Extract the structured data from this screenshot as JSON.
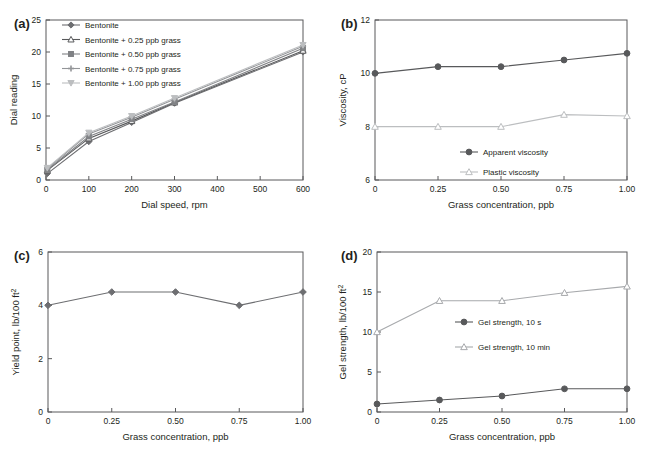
{
  "figure": {
    "panels": [
      "a",
      "b",
      "c",
      "d"
    ]
  },
  "panel_a": {
    "tag": "(a)",
    "chart_data": {
      "type": "line",
      "title": "",
      "xlabel": "Dial speed, rpm",
      "ylabel": "Dial reading",
      "xlim": [
        0,
        600
      ],
      "ylim": [
        0,
        25
      ],
      "xticks": [
        0,
        100,
        200,
        300,
        400,
        500,
        600
      ],
      "xticklabels": [
        "0",
        "100",
        "200",
        "300",
        "400",
        "500",
        "600"
      ],
      "yticks": [
        0,
        5,
        10,
        15,
        20,
        25
      ],
      "yticklabels": [
        "0",
        "5",
        "10",
        "15",
        "20",
        "25"
      ],
      "grid": false,
      "legend_position": "upper left",
      "x": [
        3,
        100,
        200,
        300,
        600
      ],
      "series": [
        {
          "name": "Bentonite",
          "values": [
            1.0,
            6.0,
            9.0,
            12.0,
            20.0
          ],
          "marker": "diamond",
          "color": "#6d6e71"
        },
        {
          "name": "Bentonite + 0.25 ppb grass",
          "values": [
            1.5,
            6.5,
            9.2,
            12.1,
            20.2
          ],
          "marker": "triangle",
          "color": "#58595b"
        },
        {
          "name": "Bentonite + 0.50 ppb grass",
          "values": [
            1.6,
            6.8,
            9.5,
            12.2,
            20.6
          ],
          "marker": "square",
          "color": "#808285"
        },
        {
          "name": "Bentonite + 0.75 ppb grass",
          "values": [
            1.8,
            7.2,
            9.8,
            12.6,
            20.9
          ],
          "marker": "cross",
          "color": "#939598"
        },
        {
          "name": "Bentonite + 1.00 ppb grass",
          "values": [
            1.9,
            7.4,
            10.0,
            12.8,
            21.1
          ],
          "marker": "triangle-down",
          "color": "#bcbec0"
        }
      ]
    }
  },
  "panel_b": {
    "tag": "(b)",
    "chart_data": {
      "type": "line",
      "title": "",
      "xlabel": "Grass concentration, ppb",
      "ylabel": "Viscosity, cP",
      "xlim": [
        0,
        1.0
      ],
      "ylim": [
        6,
        12
      ],
      "xticks": [
        0,
        0.25,
        0.5,
        0.75,
        1.0
      ],
      "xticklabels": [
        "0",
        "0.25",
        "0.50",
        "0.75",
        "1.00"
      ],
      "yticks": [
        6,
        8,
        10,
        12
      ],
      "yticklabels": [
        "6",
        "8",
        "10",
        "12"
      ],
      "grid": false,
      "legend_position": "lower center",
      "x": [
        0,
        0.25,
        0.5,
        0.75,
        1.0
      ],
      "series": [
        {
          "name": "Apparent viscosity",
          "values": [
            10.0,
            10.25,
            10.25,
            10.5,
            10.75
          ],
          "marker": "circle",
          "color": "#58595b"
        },
        {
          "name": "Plastic viscosity",
          "values": [
            8.0,
            8.0,
            8.0,
            8.45,
            8.4
          ],
          "marker": "triangle",
          "color": "#bcbec0"
        }
      ]
    }
  },
  "panel_c": {
    "tag": "(c)",
    "chart_data": {
      "type": "line",
      "title": "",
      "xlabel": "Grass concentration, ppb",
      "ylabel": "Yield point, lb/100 ft",
      "ylabel_sup": "2",
      "xlim": [
        0,
        1.0
      ],
      "ylim": [
        0,
        6
      ],
      "xticks": [
        0,
        0.25,
        0.5,
        0.75,
        1.0
      ],
      "xticklabels": [
        "0",
        "0.25",
        "0.50",
        "0.75",
        "1.00"
      ],
      "yticks": [
        0,
        2,
        4,
        6
      ],
      "yticklabels": [
        "0",
        "2",
        "4",
        "6"
      ],
      "grid": false,
      "legend_position": "none",
      "x": [
        0,
        0.25,
        0.5,
        0.75,
        1.0
      ],
      "series": [
        {
          "name": "Yield point",
          "values": [
            4.0,
            4.5,
            4.5,
            4.0,
            4.5
          ],
          "marker": "diamond",
          "color": "#6d6e71"
        }
      ]
    }
  },
  "panel_d": {
    "tag": "(d)",
    "chart_data": {
      "type": "line",
      "title": "",
      "xlabel": "Grass concentration, ppb",
      "ylabel": "Gel strength, lb/100 ft",
      "ylabel_sup": "2",
      "xlim": [
        0,
        1.0
      ],
      "ylim": [
        0,
        20
      ],
      "xticks": [
        0,
        0.25,
        0.5,
        0.75,
        1.0
      ],
      "xticklabels": [
        "0",
        "0.25",
        "0.50",
        "0.75",
        "1.00"
      ],
      "yticks": [
        0,
        5,
        10,
        15,
        20
      ],
      "yticklabels": [
        "0",
        "5",
        "10",
        "15",
        "20"
      ],
      "grid": false,
      "legend_position": "center",
      "x": [
        0,
        0.25,
        0.5,
        0.75,
        1.0
      ],
      "series": [
        {
          "name": "Gel strength, 10 s",
          "values": [
            1.0,
            1.5,
            2.0,
            2.9,
            2.9
          ],
          "marker": "circle",
          "color": "#58595b"
        },
        {
          "name": "Gel strength, 10 min",
          "values": [
            10.0,
            13.9,
            13.9,
            14.9,
            15.7
          ],
          "marker": "triangle",
          "color": "#a7a9ac"
        }
      ]
    }
  }
}
